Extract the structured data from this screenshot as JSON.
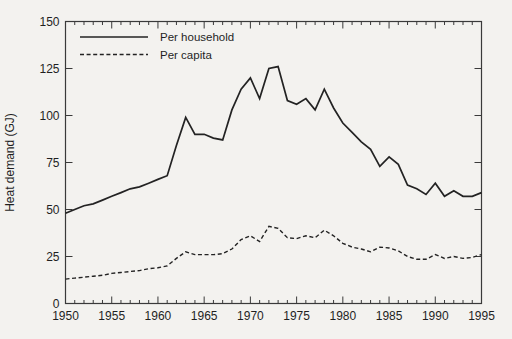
{
  "figure": {
    "background_color": "#f3f2ef",
    "line_color": "#232323"
  },
  "chart_data": {
    "type": "line",
    "title": "",
    "xlabel": "",
    "ylabel": "Heat demand (GJ)",
    "xlim": [
      1950,
      1995
    ],
    "ylim": [
      0,
      150
    ],
    "x_major_ticks": [
      1950,
      1955,
      1960,
      1965,
      1970,
      1975,
      1980,
      1985,
      1990,
      1995
    ],
    "x_minor_tick_step": 1,
    "y_ticks": [
      0,
      25,
      50,
      75,
      100,
      125,
      150
    ],
    "grid": false,
    "legend_position": "top-left-inside",
    "years": [
      1950,
      1951,
      1952,
      1953,
      1954,
      1955,
      1956,
      1957,
      1958,
      1959,
      1960,
      1961,
      1962,
      1963,
      1964,
      1965,
      1966,
      1967,
      1968,
      1969,
      1970,
      1971,
      1972,
      1973,
      1974,
      1975,
      1976,
      1977,
      1978,
      1979,
      1980,
      1981,
      1982,
      1983,
      1984,
      1985,
      1986,
      1987,
      1988,
      1989,
      1990,
      1991,
      1992,
      1993,
      1994,
      1995
    ],
    "series": [
      {
        "name": "Per household",
        "line_style": "solid",
        "values": [
          48,
          50,
          52,
          53,
          55,
          57,
          59,
          61,
          62,
          64,
          66,
          68,
          84,
          99,
          90,
          90,
          88,
          87,
          103,
          114,
          120,
          109,
          125,
          126,
          108,
          106,
          109,
          103,
          114,
          104,
          96,
          91,
          86,
          82,
          73,
          78,
          74,
          63,
          61,
          58,
          64,
          57,
          60,
          57,
          57,
          59
        ]
      },
      {
        "name": "Per capita",
        "line_style": "dashed",
        "values": [
          13,
          13.5,
          14,
          14.5,
          15,
          16,
          16.5,
          17,
          17.5,
          18.5,
          19,
          20,
          24,
          27.5,
          26,
          26,
          26,
          26.5,
          29,
          34,
          36,
          33,
          41,
          40,
          35,
          34.5,
          36,
          35,
          39,
          36,
          32,
          30,
          29,
          27.5,
          30,
          29.5,
          28,
          25,
          23.5,
          23.5,
          26,
          24,
          25,
          24,
          24.5,
          26
        ]
      }
    ]
  }
}
